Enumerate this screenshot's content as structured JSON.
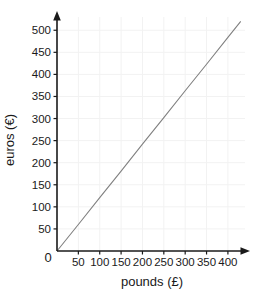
{
  "chart_data": {
    "type": "line",
    "title": "",
    "xlabel": "pounds (£)",
    "ylabel": "euros (€)",
    "xlim": [
      0,
      440
    ],
    "ylim": [
      0,
      530
    ],
    "grid": true,
    "legend": null,
    "x_ticks": [
      0,
      50,
      100,
      150,
      200,
      250,
      300,
      350,
      400
    ],
    "y_ticks": [
      0,
      50,
      100,
      150,
      200,
      250,
      300,
      350,
      400,
      450,
      500
    ],
    "x_tick_labels": [
      "0",
      "50",
      "100",
      "150",
      "200",
      "250",
      "300",
      "350",
      "400"
    ],
    "y_tick_labels": [
      "0",
      "50",
      "100",
      "150",
      "200",
      "250",
      "300",
      "350",
      "400",
      "450",
      "500"
    ],
    "origin_label": "0",
    "series": [
      {
        "name": "pounds to euros conversion",
        "x": [
          0,
          50,
          100,
          150,
          200,
          250,
          300,
          350,
          400,
          430
        ],
        "values": [
          0,
          60,
          121,
          181,
          242,
          302,
          363,
          423,
          484,
          520
        ],
        "color": "#808080"
      }
    ],
    "slope_euros_per_pound": 1.21,
    "axis_color": "#1a1a1a",
    "grid_color": "#f2f2f2",
    "background_color": "#ffffff"
  },
  "axes": {
    "x_axis_name": "pounds-axis",
    "y_axis_name": "euros-axis",
    "arrowheads": true
  }
}
